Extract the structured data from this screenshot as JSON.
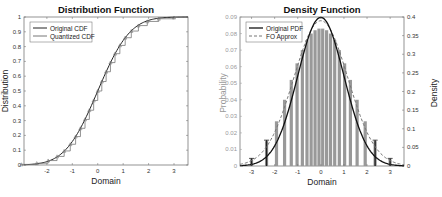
{
  "chart_data": [
    {
      "type": "line",
      "title": "Distribution Function",
      "xlabel": "Domain",
      "ylabel": "Distribution",
      "xlim": [
        -2.9,
        3.55
      ],
      "ylim": [
        0,
        1
      ],
      "xticks": [
        -2,
        -1,
        0,
        1,
        2,
        3
      ],
      "yticks": [
        0,
        0.1,
        0.2,
        0.3,
        0.4,
        0.5,
        0.6,
        0.7,
        0.8,
        0.9,
        1
      ],
      "ytick_labels": [
        "0",
        "0.1",
        "0.2",
        "0.3",
        "0.4",
        "0.5",
        "0.6",
        "0.7",
        "0.8",
        "0.9",
        "1"
      ],
      "legend_position": "upper left",
      "series": [
        {
          "name": "Original CDF",
          "style": "solid",
          "color": "#222222",
          "function": "normal_cdf(mu=0, sigma=1)"
        },
        {
          "name": "Quantized CDF",
          "style": "staircase",
          "color": "#666666",
          "x": [
            -3.0,
            -2.4,
            -1.95,
            -1.6,
            -1.32,
            -1.08,
            -0.87,
            -0.68,
            -0.5,
            -0.33,
            -0.16,
            0.0,
            0.16,
            0.33,
            0.5,
            0.68,
            0.87,
            1.08,
            1.32,
            1.6,
            1.95,
            2.4,
            3.0
          ],
          "y": [
            0.004,
            0.012,
            0.03,
            0.058,
            0.095,
            0.14,
            0.192,
            0.248,
            0.308,
            0.37,
            0.436,
            0.5,
            0.564,
            0.63,
            0.692,
            0.752,
            0.808,
            0.86,
            0.905,
            0.942,
            0.97,
            0.988,
            0.996
          ]
        }
      ]
    },
    {
      "type": "bar",
      "title": "Density Function",
      "xlabel": "Domain",
      "ylabel_left": "Probability",
      "ylabel_right": "Density",
      "xlim": [
        -3.5,
        3.6
      ],
      "ylim_left": [
        0,
        0.09
      ],
      "ylim_right": [
        0,
        0.4
      ],
      "xticks": [
        -3,
        -2,
        -1,
        0,
        1,
        2,
        3
      ],
      "yticks_left": [
        0,
        0.01,
        0.02,
        0.03,
        0.04,
        0.05,
        0.06,
        0.07,
        0.08,
        0.09
      ],
      "ytick_labels_left": [
        "0",
        "0.01",
        "0.02",
        "0.03",
        "0.04",
        "0.05",
        "0.06",
        "0.07",
        "0.08",
        "0.09"
      ],
      "yticks_right": [
        0,
        0.05,
        0.1,
        0.15,
        0.2,
        0.25,
        0.3,
        0.35,
        0.4
      ],
      "ytick_labels_right": [
        "0",
        "0.05",
        "0.1",
        "0.15",
        "0.2",
        "0.25",
        "0.3",
        "0.35",
        "0.4"
      ],
      "legend_position": "upper left",
      "bars": {
        "name": "Quantized probability",
        "color": "#999999",
        "x": [
          -3.0,
          -2.35,
          -1.92,
          -1.57,
          -1.28,
          -1.03,
          -0.8,
          -0.6,
          -0.42,
          -0.25,
          -0.08,
          0.08,
          0.25,
          0.42,
          0.6,
          0.8,
          1.03,
          1.28,
          1.57,
          1.92,
          2.35,
          3.0
        ],
        "values": [
          0.004,
          0.015,
          0.027,
          0.04,
          0.052,
          0.062,
          0.07,
          0.076,
          0.08,
          0.082,
          0.083,
          0.083,
          0.082,
          0.08,
          0.076,
          0.07,
          0.062,
          0.052,
          0.04,
          0.027,
          0.015,
          0.004
        ]
      },
      "series": [
        {
          "name": "Original PDF",
          "style": "solid",
          "color": "#111111",
          "function": "normal_pdf(mu=0, sigma=1)",
          "axis": "right"
        },
        {
          "name": "FO Approx",
          "style": "dashed",
          "color": "#777777",
          "function": "approx_pdf(sigma≈1.12)",
          "axis": "right"
        }
      ],
      "markers": {
        "x": [
          -3.0,
          -2.35,
          2.35,
          3.0
        ],
        "note": "dark stems at outer quantization levels"
      }
    }
  ],
  "left_chart": {
    "title": "Distribution Function",
    "xlabel": "Domain",
    "ylabel": "Distribution",
    "legend": [
      "Original CDF",
      "Quantized CDF"
    ]
  },
  "right_chart": {
    "title": "Density Function",
    "xlabel": "Domain",
    "ylabel_left": "Probability",
    "ylabel_right": "Density",
    "legend": [
      "Original PDF",
      "FO Approx"
    ]
  }
}
